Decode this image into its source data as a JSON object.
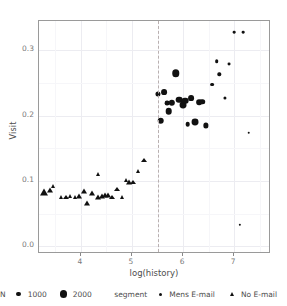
{
  "chart_data": {
    "type": "scatter",
    "title": "",
    "xlabel": "log(history)",
    "ylabel": "Visit",
    "xlim": [
      3.18,
      7.72
    ],
    "ylim": [
      -0.012,
      0.345
    ],
    "xticks": [
      "4",
      "5",
      "6",
      "7"
    ],
    "xtickvals": [
      4,
      5,
      6,
      7
    ],
    "yticks": [
      "0.0",
      "0.1",
      "0.2",
      "0.3"
    ],
    "ytickvals": [
      0.0,
      0.1,
      0.2,
      0.3
    ],
    "grid": true,
    "legend_position": "bottom",
    "annotations": [
      {
        "type": "vline",
        "x": 5.5,
        "style": "dashed",
        "color": "#b9b0b0"
      }
    ],
    "size_legend": {
      "title": "N",
      "breaks": [
        "1000",
        "2000"
      ],
      "values": [
        1000,
        2000
      ]
    },
    "shape_legend": {
      "title": "segment",
      "labels": [
        "Mens E-mail",
        "No E-mail"
      ],
      "shapes": [
        "circle",
        "triangle"
      ]
    },
    "series": [
      {
        "name": "Mens E-mail",
        "shape": "circle",
        "points": [
          {
            "x": 5.5,
            "y": 0.2335,
            "n": 900
          },
          {
            "x": 5.56,
            "y": 0.1925,
            "n": 1450
          },
          {
            "x": 5.63,
            "y": 0.2355,
            "n": 1150
          },
          {
            "x": 5.68,
            "y": 0.2195,
            "n": 800
          },
          {
            "x": 5.72,
            "y": 0.2065,
            "n": 1450
          },
          {
            "x": 5.78,
            "y": 0.22,
            "n": 1350
          },
          {
            "x": 5.86,
            "y": 0.265,
            "n": 1850
          },
          {
            "x": 5.92,
            "y": 0.2245,
            "n": 1500
          },
          {
            "x": 5.99,
            "y": 0.216,
            "n": 1600
          },
          {
            "x": 6.04,
            "y": 0.223,
            "n": 1500
          },
          {
            "x": 6.09,
            "y": 0.187,
            "n": 750
          },
          {
            "x": 6.16,
            "y": 0.2275,
            "n": 1150
          },
          {
            "x": 6.24,
            "y": 0.19,
            "n": 1600
          },
          {
            "x": 6.31,
            "y": 0.221,
            "n": 1100
          },
          {
            "x": 6.37,
            "y": 0.2215,
            "n": 1050
          },
          {
            "x": 6.44,
            "y": 0.185,
            "n": 950
          },
          {
            "x": 6.57,
            "y": 0.2475,
            "n": 520
          },
          {
            "x": 6.66,
            "y": 0.283,
            "n": 480
          },
          {
            "x": 6.71,
            "y": 0.2635,
            "n": 430
          },
          {
            "x": 6.82,
            "y": 0.2275,
            "n": 360
          },
          {
            "x": 6.89,
            "y": 0.279,
            "n": 330
          },
          {
            "x": 7.0,
            "y": 0.328,
            "n": 280
          },
          {
            "x": 7.18,
            "y": 0.328,
            "n": 280
          },
          {
            "x": 7.28,
            "y": 0.1735,
            "n": 260
          },
          {
            "x": 7.11,
            "y": 0.0325,
            "n": 220
          }
        ]
      },
      {
        "name": "No E-mail",
        "shape": "triangle",
        "points": [
          {
            "x": 3.28,
            "y": 0.0865,
            "n": 2000
          },
          {
            "x": 3.4,
            "y": 0.088,
            "n": 1100
          },
          {
            "x": 3.45,
            "y": 0.094,
            "n": 700
          },
          {
            "x": 3.62,
            "y": 0.078,
            "n": 780
          },
          {
            "x": 3.7,
            "y": 0.077,
            "n": 820
          },
          {
            "x": 3.79,
            "y": 0.079,
            "n": 760
          },
          {
            "x": 3.88,
            "y": 0.077,
            "n": 800
          },
          {
            "x": 3.97,
            "y": 0.079,
            "n": 860
          },
          {
            "x": 4.06,
            "y": 0.0865,
            "n": 900
          },
          {
            "x": 4.12,
            "y": 0.069,
            "n": 880
          },
          {
            "x": 4.22,
            "y": 0.083,
            "n": 840
          },
          {
            "x": 4.33,
            "y": 0.1125,
            "n": 800
          },
          {
            "x": 4.33,
            "y": 0.0775,
            "n": 880
          },
          {
            "x": 4.41,
            "y": 0.079,
            "n": 900
          },
          {
            "x": 4.47,
            "y": 0.08,
            "n": 860
          },
          {
            "x": 4.54,
            "y": 0.0805,
            "n": 840
          },
          {
            "x": 4.61,
            "y": 0.077,
            "n": 820
          },
          {
            "x": 4.71,
            "y": 0.09,
            "n": 820
          },
          {
            "x": 4.8,
            "y": 0.078,
            "n": 800
          },
          {
            "x": 4.89,
            "y": 0.1035,
            "n": 800
          },
          {
            "x": 4.95,
            "y": 0.1,
            "n": 860
          },
          {
            "x": 5.02,
            "y": 0.1,
            "n": 820
          },
          {
            "x": 5.12,
            "y": 0.118,
            "n": 780
          },
          {
            "x": 5.24,
            "y": 0.135,
            "n": 820
          }
        ]
      }
    ]
  }
}
